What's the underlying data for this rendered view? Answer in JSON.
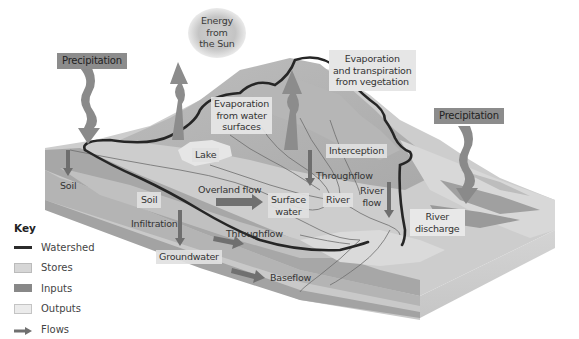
{
  "diagram": {
    "colors": {
      "watershed": "#2b2b2b",
      "stores": "#d6d6d6",
      "inputs": "#888888",
      "outputs": "#ebebeb",
      "flows": "#707070",
      "land_light": "#c8c8c8",
      "land_mid": "#a8a8a8",
      "block_side": "#d0d0d0"
    },
    "sun": {
      "label_lines": [
        "Energy",
        "from",
        "the Sun"
      ]
    },
    "inputs": {
      "precipitation_left": "Precipitation",
      "precipitation_right": "Precipitation"
    },
    "outputs": {
      "evaporation_water_lines": [
        "Evaporation",
        "from water",
        "surfaces"
      ],
      "evapotranspiration_lines": [
        "Evaporation",
        "and transpiration",
        "from vegetation"
      ],
      "river_discharge_lines": [
        "River",
        "discharge"
      ]
    },
    "stores": {
      "lake": "Lake",
      "interception": "Interception",
      "soil_left": "Soil",
      "soil_mid": "Soil",
      "surface_water_lines": [
        "Surface",
        "water"
      ],
      "river": "River",
      "groundwater": "Groundwater"
    },
    "flows": {
      "overland_flow": "Overland flow",
      "throughflow_upper": "Throughflow",
      "throughflow_lower": "Throughflow",
      "infiltration": "Infiltration",
      "river_flow_lines": [
        "River",
        "flow"
      ],
      "baseflow": "Baseflow"
    }
  },
  "key": {
    "title": "Key",
    "items": [
      {
        "label": "Watershed",
        "icon": "line-swatch"
      },
      {
        "label": "Stores",
        "icon": "light-box-swatch"
      },
      {
        "label": "Inputs",
        "icon": "dark-box-swatch"
      },
      {
        "label": "Outputs",
        "icon": "pale-box-swatch"
      },
      {
        "label": "Flows",
        "icon": "arrow-swatch"
      }
    ]
  }
}
